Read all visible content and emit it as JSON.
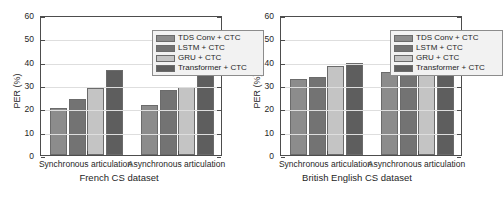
{
  "figure": {
    "panels": [
      "left",
      "right"
    ]
  },
  "legend": {
    "entries": [
      {
        "label": "TDS Conv + CTC",
        "color": "#8c8c8c"
      },
      {
        "label": "LSTM + CTC",
        "color": "#737373"
      },
      {
        "label": "GRU + CTC",
        "color": "#c4c4c4"
      },
      {
        "label": "Transformer + CTC",
        "color": "#5e5e5e"
      }
    ]
  },
  "chart_data": [
    {
      "type": "bar",
      "title": "French CS dataset",
      "xlabel": "French CS dataset",
      "ylabel": "PER (%)",
      "ylim": [
        0,
        60
      ],
      "yticks": [
        0,
        10,
        20,
        30,
        40,
        50,
        60
      ],
      "ytick_labels": [
        "0",
        "10",
        "20",
        "30",
        "40",
        "50",
        "60"
      ],
      "grid": true,
      "legend_position": "upper right",
      "categories": [
        "Synchronous articulation",
        "Asynchronous articulation"
      ],
      "series": [
        {
          "name": "TDS Conv + CTC",
          "color": "#8c8c8c",
          "values": [
            20.3,
            21.3
          ]
        },
        {
          "name": "LSTM + CTC",
          "color": "#737373",
          "values": [
            24.2,
            28.0
          ]
        },
        {
          "name": "GRU + CTC",
          "color": "#c4c4c4",
          "values": [
            28.7,
            29.2
          ]
        },
        {
          "name": "Transformer + CTC",
          "color": "#5e5e5e",
          "values": [
            36.5,
            38.0
          ]
        }
      ]
    },
    {
      "type": "bar",
      "title": "British English CS dataset",
      "xlabel": "British English CS dataset",
      "ylabel": "PER (%)",
      "ylim": [
        0,
        60
      ],
      "yticks": [
        0,
        10,
        20,
        30,
        40,
        50,
        60
      ],
      "ytick_labels": [
        "0",
        "10",
        "20",
        "30",
        "40",
        "50",
        "60"
      ],
      "grid": true,
      "legend_position": "upper right",
      "categories": [
        "Synchronous articulation",
        "Asynchronous articulation"
      ],
      "series": [
        {
          "name": "TDS Conv + CTC",
          "color": "#8c8c8c",
          "values": [
            32.7,
            35.6
          ]
        },
        {
          "name": "LSTM + CTC",
          "color": "#737373",
          "values": [
            33.3,
            37.0
          ]
        },
        {
          "name": "GRU + CTC",
          "color": "#c4c4c4",
          "values": [
            38.2,
            41.2
          ]
        },
        {
          "name": "Transformer + CTC",
          "color": "#5e5e5e",
          "values": [
            39.5,
            42.2
          ]
        }
      ]
    }
  ]
}
